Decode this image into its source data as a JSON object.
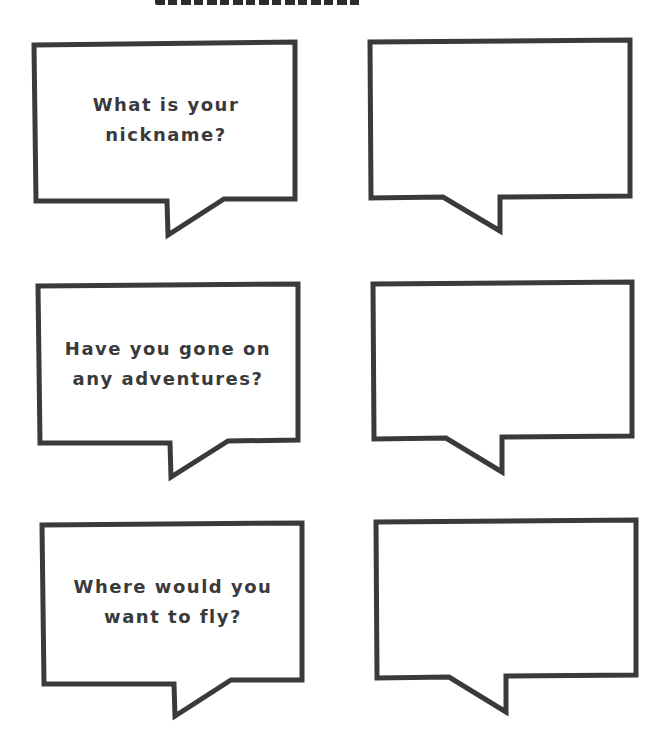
{
  "page": {
    "title_visible": false
  },
  "colors": {
    "outline": "#3a3a3c",
    "background": "#ffffff",
    "text": "#3a3a3c"
  },
  "bubbles": [
    {
      "id": "q1",
      "column": "left",
      "text": "What is your\nnickname?"
    },
    {
      "id": "a1",
      "column": "right",
      "text": ""
    },
    {
      "id": "q2",
      "column": "left",
      "text": "Have you gone on\nany adventures?"
    },
    {
      "id": "a2",
      "column": "right",
      "text": ""
    },
    {
      "id": "q3",
      "column": "left",
      "text": "Where would you\nwant to fly?"
    },
    {
      "id": "a3",
      "column": "right",
      "text": ""
    }
  ]
}
